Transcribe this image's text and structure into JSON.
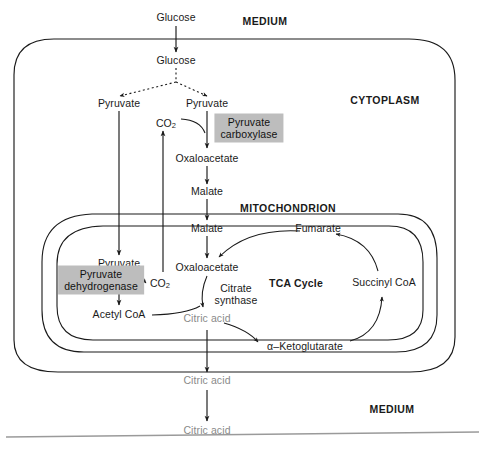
{
  "figure": {
    "ink_color": "#1a1a1a",
    "muted_color": "#8a8a8a",
    "enzyme_box_color": "#bdbdbd"
  },
  "compartments": [
    {
      "name": "medium-top",
      "label": "MEDIUM"
    },
    {
      "name": "cytoplasm",
      "label": "CYTOPLASM"
    },
    {
      "name": "mitochondrion",
      "label": "MITOCHONDRION"
    },
    {
      "name": "medium-bottom",
      "label": "MEDIUM"
    }
  ],
  "metabolites": {
    "glucose_medium": "Glucose",
    "glucose_cytoplasm": "Glucose",
    "pyruvate_cyto_left": "Pyruvate",
    "pyruvate_cyto_right": "Pyruvate",
    "co2_cytoplasm": "CO",
    "co2_cytoplasm_sub": "2",
    "oxaloacetate_cyto": "Oxaloacetate",
    "malate_cyto": "Malate",
    "malate_mito": "Malate",
    "pyruvate_mito": "Pyruvate",
    "co2_mito": "CO",
    "co2_mito_sub": "2",
    "acetyl_coa": "Acetyl CoA",
    "oxaloacetate_mito": "Oxaloacetate",
    "citric_acid_mito": "Citric acid",
    "alpha_ketoglutarate": "α–Ketoglutarate",
    "succinyl_coa": "Succinyl CoA",
    "fumarate": "Fumarate",
    "citric_acid_cyto": "Citric acid",
    "citric_acid_medium": "Citric acid"
  },
  "enzymes": [
    {
      "name": "pyruvate-carboxylase",
      "line1": "Pyruvate",
      "line2": "carboxylase",
      "boxed": true
    },
    {
      "name": "pyruvate-dehydrogenase",
      "line1": "Pyruvate",
      "line2": "dehydrogenase",
      "boxed": true
    },
    {
      "name": "citrate-synthase",
      "line1": "Citrate",
      "line2": "synthase",
      "boxed": false
    }
  ],
  "cycle": {
    "label": "TCA Cycle"
  }
}
